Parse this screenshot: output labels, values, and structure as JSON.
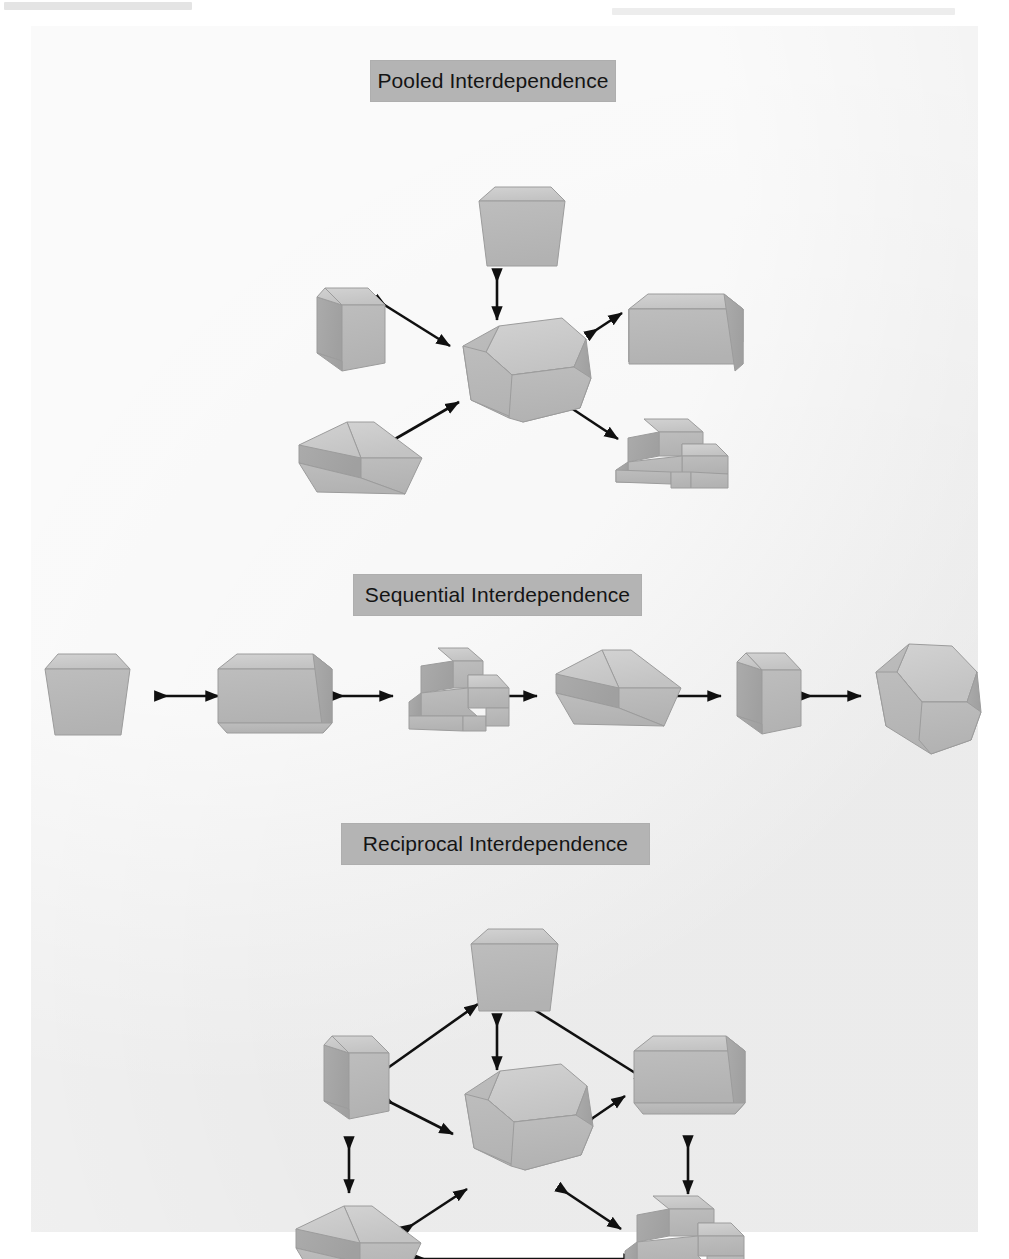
{
  "figure": {
    "kind": "scanned-textbook-figure",
    "sections": [
      {
        "id": "pooled",
        "caption": "Pooled Interdependence",
        "description": "Six unit blocks arranged around one central hub block, each connected to the hub by a double-headed arrow.",
        "node_count": 7,
        "arrow_count": 6,
        "nodes": [
          {
            "id": "p-hub",
            "shape": "hexagonal-prism",
            "role": "hub",
            "label": ""
          },
          {
            "id": "p-top",
            "shape": "tapered-block",
            "role": "unit",
            "label": ""
          },
          {
            "id": "p-left",
            "shape": "chamfered-cube",
            "role": "unit",
            "label": ""
          },
          {
            "id": "p-right",
            "shape": "large-cube",
            "role": "unit",
            "label": ""
          },
          {
            "id": "p-botleft",
            "shape": "wedge-block",
            "role": "unit",
            "label": ""
          },
          {
            "id": "p-botright",
            "shape": "stepped-block",
            "role": "unit",
            "label": ""
          }
        ],
        "links": [
          {
            "from": "p-top",
            "to": "p-hub",
            "style": "double-arrow"
          },
          {
            "from": "p-left",
            "to": "p-hub",
            "style": "double-arrow"
          },
          {
            "from": "p-right",
            "to": "p-hub",
            "style": "double-arrow"
          },
          {
            "from": "p-botleft",
            "to": "p-hub",
            "style": "double-arrow"
          },
          {
            "from": "p-botright",
            "to": "p-hub",
            "style": "double-arrow"
          }
        ]
      },
      {
        "id": "sequential",
        "caption": "Sequential Interdependence",
        "description": "Six unit blocks laid out in a single horizontal chain, each joined to the next by a double-headed arrow.",
        "node_count": 6,
        "arrow_count": 5,
        "nodes": [
          {
            "id": "s-1",
            "shape": "tapered-block",
            "role": "unit",
            "label": ""
          },
          {
            "id": "s-2",
            "shape": "large-cube",
            "role": "unit",
            "label": ""
          },
          {
            "id": "s-3",
            "shape": "stepped-block",
            "role": "unit",
            "label": ""
          },
          {
            "id": "s-4",
            "shape": "wedge-block",
            "role": "unit",
            "label": ""
          },
          {
            "id": "s-5",
            "shape": "chamfered-cube",
            "role": "unit",
            "label": ""
          },
          {
            "id": "s-6",
            "shape": "hexagonal-prism",
            "role": "unit",
            "label": ""
          }
        ],
        "links": [
          {
            "from": "s-1",
            "to": "s-2",
            "style": "double-arrow"
          },
          {
            "from": "s-2",
            "to": "s-3",
            "style": "double-arrow"
          },
          {
            "from": "s-3",
            "to": "s-4",
            "style": "double-arrow"
          },
          {
            "from": "s-4",
            "to": "s-5",
            "style": "double-arrow"
          },
          {
            "from": "s-5",
            "to": "s-6",
            "style": "double-arrow"
          }
        ]
      },
      {
        "id": "reciprocal",
        "caption": "Reciprocal Interdependence",
        "description": "Six unit blocks ringed around one central hub block; every unit links to the hub and to its neighbours with double-headed arrows.",
        "node_count": 7,
        "arrow_count": 11,
        "nodes": [
          {
            "id": "r-hub",
            "shape": "hexagonal-prism",
            "role": "hub",
            "label": ""
          },
          {
            "id": "r-top",
            "shape": "tapered-block",
            "role": "unit",
            "label": ""
          },
          {
            "id": "r-left",
            "shape": "chamfered-cube",
            "role": "unit",
            "label": ""
          },
          {
            "id": "r-right",
            "shape": "large-cube",
            "role": "unit",
            "label": ""
          },
          {
            "id": "r-botleft",
            "shape": "wedge-block",
            "role": "unit",
            "label": ""
          },
          {
            "id": "r-botright",
            "shape": "stepped-block",
            "role": "unit",
            "label": ""
          }
        ],
        "links": [
          {
            "from": "r-top",
            "to": "r-hub",
            "style": "double-arrow"
          },
          {
            "from": "r-left",
            "to": "r-hub",
            "style": "double-arrow"
          },
          {
            "from": "r-right",
            "to": "r-hub",
            "style": "double-arrow"
          },
          {
            "from": "r-botleft",
            "to": "r-hub",
            "style": "double-arrow"
          },
          {
            "from": "r-botright",
            "to": "r-hub",
            "style": "double-arrow"
          },
          {
            "from": "r-top",
            "to": "r-left",
            "style": "double-arrow"
          },
          {
            "from": "r-top",
            "to": "r-right",
            "style": "double-arrow"
          },
          {
            "from": "r-left",
            "to": "r-botleft",
            "style": "double-arrow"
          },
          {
            "from": "r-right",
            "to": "r-botright",
            "style": "double-arrow"
          },
          {
            "from": "r-botleft",
            "to": "r-botright",
            "style": "double-arrow"
          }
        ]
      }
    ]
  },
  "colors": {
    "page_background": "#ffffff",
    "panel_background": "#f1f1f1",
    "caption_background": "#b4b4b4",
    "caption_text": "#141414",
    "shape_top_face": "#c8c8c8",
    "shape_front_face": "#b9b9b9",
    "shape_side_face": "#a9a9a9",
    "shape_outline": "#9a9a9a",
    "arrow_stroke": "#101010"
  }
}
